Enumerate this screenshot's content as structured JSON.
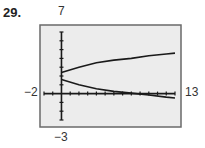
{
  "problem_number": "29.",
  "window_labels": {
    "ymax": "7",
    "ymin": "−3",
    "xmin": "−2",
    "xmax": "13"
  },
  "colors": {
    "frame_fill": "#ececec",
    "frame_stroke": "#6a6a6a",
    "curve": "#1a1a1a"
  },
  "chart_data": {
    "type": "line",
    "title": "",
    "xlabel": "",
    "ylabel": "",
    "xlim": [
      -2,
      13
    ],
    "ylim": [
      -3,
      7
    ],
    "xscl": 1,
    "yscl": 1,
    "grid": false,
    "series": [
      {
        "name": "upper branch",
        "x": [
          0,
          2,
          4,
          6,
          8,
          10,
          12,
          13
        ],
        "y": [
          2.4,
          3.0,
          3.5,
          3.8,
          4.0,
          4.3,
          4.5,
          4.6
        ]
      },
      {
        "name": "lower branch",
        "x": [
          0,
          2,
          4,
          6,
          8,
          10,
          12,
          13
        ],
        "y": [
          1.6,
          1.0,
          0.55,
          0.25,
          0.05,
          -0.15,
          -0.4,
          -0.5
        ]
      }
    ]
  }
}
